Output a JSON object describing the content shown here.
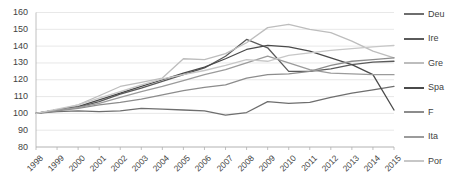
{
  "chart_data": {
    "type": "line",
    "title": "",
    "xlabel": "",
    "ylabel": "",
    "ylim": [
      80,
      160
    ],
    "ytick_step": 10,
    "yticks": [
      160,
      150,
      140,
      130,
      120,
      110,
      100,
      90,
      80
    ],
    "grid": true,
    "legend_position": "right",
    "categories": [
      "1998",
      "1999",
      "2000",
      "2001",
      "2002",
      "2003",
      "2004",
      "2005",
      "2006",
      "2007",
      "2008",
      "2009",
      "2010",
      "2011",
      "2012",
      "2013",
      "2014",
      "2015"
    ],
    "series": [
      {
        "name": "Deu",
        "color": "#6e6e6e",
        "values": [
          100,
          101,
          101.5,
          101,
          101.5,
          103,
          102.5,
          102,
          101.5,
          99,
          100.5,
          107,
          106,
          106.5,
          109.5,
          112,
          114,
          116
        ]
      },
      {
        "name": "Ire",
        "color": "#5a5a5a",
        "values": [
          100,
          102,
          103.5,
          107,
          111.5,
          115,
          119,
          123,
          127,
          134,
          144,
          139,
          125,
          125,
          126.5,
          129,
          130.5,
          131
        ]
      },
      {
        "name": "Gre",
        "color": "#bdbdbd",
        "values": [
          100,
          102,
          105,
          110.5,
          116,
          118.5,
          121,
          132.5,
          132,
          135.5,
          142,
          151,
          153,
          150,
          148,
          143,
          137,
          133
        ]
      },
      {
        "name": "Spa",
        "color": "#4a4a4a",
        "values": [
          100,
          102,
          104,
          108,
          112,
          116,
          120,
          124,
          127.5,
          132.5,
          138,
          140.5,
          139.5,
          137,
          133,
          129,
          123,
          102
        ]
      },
      {
        "name": "F",
        "color": "#8c8c8c",
        "values": [
          100,
          101.5,
          103,
          105,
          106.5,
          108.5,
          111,
          113.5,
          115.5,
          117,
          121,
          123,
          123.5,
          125,
          128.5,
          131,
          132,
          133
        ]
      },
      {
        "name": "Ita",
        "color": "#9b9b9b",
        "values": [
          100,
          102,
          103.5,
          106,
          109.5,
          113,
          116,
          119.5,
          123,
          126,
          130,
          134,
          130,
          126,
          124,
          123.5,
          123,
          123
        ]
      },
      {
        "name": "Por",
        "color": "#c7c7c7",
        "values": [
          100,
          102.5,
          105,
          109,
          113,
          117,
          120.5,
          123,
          125.5,
          128.5,
          132,
          131,
          134.5,
          136,
          137.5,
          138.5,
          139.5,
          140.5
        ]
      }
    ]
  },
  "legend": {
    "items": [
      {
        "label": "Deu"
      },
      {
        "label": "Ire"
      },
      {
        "label": "Gre"
      },
      {
        "label": "Spa"
      },
      {
        "label": "F"
      },
      {
        "label": "Ita"
      },
      {
        "label": "Por"
      }
    ]
  }
}
